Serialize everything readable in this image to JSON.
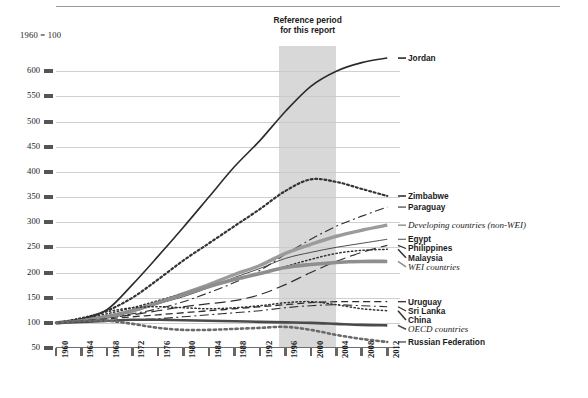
{
  "base_note": "1960 = 100",
  "reference_band": {
    "caption_line1": "Reference period",
    "caption_line2": "for this report",
    "start": 1995,
    "end": 2004,
    "fill": "#c9c9c9"
  },
  "chart_data": {
    "type": "line",
    "title": "",
    "subtitle": "",
    "xlabel": "",
    "ylabel": "",
    "note": "1960 = 100",
    "grid": true,
    "legend_position": "right-inline-labels",
    "xlim": [
      1960,
      2014
    ],
    "ylim": [
      50,
      650
    ],
    "yticks": [
      50,
      100,
      150,
      200,
      250,
      300,
      350,
      400,
      450,
      500,
      550,
      600
    ],
    "xticks": [
      1960,
      1964,
      1968,
      1972,
      1976,
      1980,
      1984,
      1988,
      1992,
      1996,
      2000,
      2004,
      2008,
      2012
    ],
    "x": [
      1960,
      1964,
      1968,
      1972,
      1976,
      1980,
      1984,
      1988,
      1992,
      1996,
      2000,
      2004,
      2008,
      2012
    ],
    "series": [
      {
        "name": "Jordan",
        "style": "solid",
        "color": "#2b2b2b",
        "width": 1.6,
        "values": [
          100,
          108,
          126,
          176,
          232,
          290,
          350,
          410,
          462,
          520,
          570,
          600,
          617,
          626
        ]
      },
      {
        "name": "Zimbabwe",
        "style": "dotted-thick",
        "color": "#333333",
        "width": 2.2,
        "values": [
          100,
          108,
          124,
          150,
          186,
          224,
          258,
          292,
          326,
          362,
          385,
          380,
          366,
          352
        ]
      },
      {
        "name": "Paraguay",
        "style": "dashdot",
        "color": "#2f2f2f",
        "width": 1.1,
        "values": [
          100,
          104,
          110,
          118,
          128,
          142,
          160,
          180,
          204,
          236,
          266,
          292,
          312,
          330
        ]
      },
      {
        "name": "Developing countries (non-WEI)",
        "style": "solid-thick-gray",
        "color": "#9b9b9b",
        "width": 3.4,
        "values": [
          100,
          104,
          112,
          124,
          140,
          158,
          176,
          196,
          214,
          238,
          256,
          272,
          284,
          294
        ]
      },
      {
        "name": "Egypt",
        "style": "solid-thin",
        "color": "#3a3a3a",
        "width": 0.9,
        "values": [
          100,
          106,
          114,
          124,
          138,
          152,
          170,
          190,
          208,
          228,
          240,
          250,
          258,
          266
        ]
      },
      {
        "name": "Philippines",
        "style": "longdash",
        "color": "#2f2f2f",
        "width": 1.2,
        "values": [
          100,
          104,
          110,
          116,
          124,
          132,
          138,
          144,
          156,
          176,
          200,
          222,
          240,
          254
        ]
      },
      {
        "name": "Malaysia",
        "style": "dotted",
        "color": "#333333",
        "width": 1.5,
        "values": [
          100,
          108,
          118,
          130,
          144,
          158,
          172,
          186,
          198,
          212,
          226,
          238,
          244,
          246
        ]
      },
      {
        "name": "WEI countries",
        "style": "solid-thick-gray",
        "color": "#8e8e8e",
        "width": 3.6,
        "values": [
          100,
          104,
          112,
          124,
          140,
          156,
          172,
          186,
          198,
          210,
          216,
          220,
          222,
          222
        ]
      },
      {
        "name": "Uruguay",
        "style": "dash",
        "color": "#2f2f2f",
        "width": 1.3,
        "values": [
          100,
          104,
          108,
          112,
          116,
          120,
          124,
          128,
          132,
          136,
          140,
          142,
          142,
          142
        ]
      },
      {
        "name": "Sri Lanka",
        "style": "dashdot",
        "color": "#2f2f2f",
        "width": 1.1,
        "values": [
          100,
          102,
          104,
          106,
          108,
          112,
          116,
          120,
          124,
          130,
          134,
          136,
          134,
          132
        ]
      },
      {
        "name": "China",
        "style": "dotted",
        "color": "#333333",
        "width": 1.5,
        "values": [
          100,
          110,
          122,
          130,
          132,
          130,
          128,
          130,
          134,
          140,
          142,
          136,
          128,
          124
        ]
      },
      {
        "name": "OECD countries",
        "style": "solid-thick-dark",
        "color": "#4a4a4a",
        "width": 2.6,
        "values": [
          100,
          102,
          104,
          106,
          106,
          105,
          104,
          103,
          102,
          101,
          100,
          98,
          96,
          95
        ]
      },
      {
        "name": "Russian Federation",
        "style": "dotted-thick",
        "color": "#6a6a6a",
        "width": 2.6,
        "values": [
          100,
          104,
          104,
          98,
          90,
          86,
          86,
          88,
          90,
          92,
          86,
          76,
          68,
          62
        ]
      }
    ]
  },
  "right_labels": [
    {
      "text": "Jordan",
      "italic": false
    },
    {
      "text": "Zimbabwe",
      "italic": false
    },
    {
      "text": "Paraguay",
      "italic": false
    },
    {
      "text": "Developing countries (non-WEI)",
      "italic": true
    },
    {
      "text": "Egypt",
      "italic": false
    },
    {
      "text": "Philippines",
      "italic": false
    },
    {
      "text": "Malaysia",
      "italic": false
    },
    {
      "text": "WEI countries",
      "italic": true
    },
    {
      "text": "Uruguay",
      "italic": false
    },
    {
      "text": "Sri Lanka",
      "italic": false
    },
    {
      "text": "China",
      "italic": false
    },
    {
      "text": "OECD countries",
      "italic": true
    },
    {
      "text": "Russian Federation",
      "italic": false
    }
  ]
}
